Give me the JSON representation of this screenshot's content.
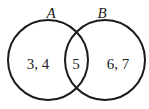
{
  "diagram": {
    "type": "venn",
    "sets": [
      {
        "name": "A",
        "cx": 48,
        "cy": 60,
        "r": 40
      },
      {
        "name": "B",
        "cx": 105,
        "cy": 60,
        "r": 40
      }
    ],
    "regions": {
      "a_only": "3, 4",
      "intersection": "5",
      "b_only": "6, 7"
    },
    "stroke_color": "#1a1a1a"
  }
}
